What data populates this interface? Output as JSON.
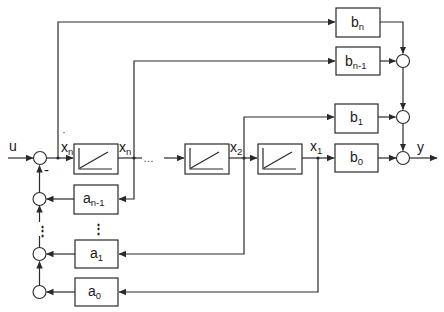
{
  "diagram": {
    "type": "block-diagram",
    "input": {
      "label": "u"
    },
    "output": {
      "label": "y"
    },
    "feedback_sign": "-",
    "states": {
      "xdot_n": {
        "base": "x",
        "sub": "n",
        "dot": "˙"
      },
      "x_n": {
        "base": "x",
        "sub": "n"
      },
      "x_2": {
        "base": "x",
        "sub": "2"
      },
      "x_1": {
        "base": "x",
        "sub": "1"
      }
    },
    "ellipsis_h": "…",
    "ellipsis_v": "⋮",
    "integrators": [
      {
        "id": "int-n",
        "symbol": "ramp"
      },
      {
        "id": "int-2",
        "symbol": "ramp"
      },
      {
        "id": "int-1",
        "symbol": "ramp"
      }
    ],
    "feedforward_gains": [
      {
        "base": "b",
        "sub": "n"
      },
      {
        "base": "b",
        "sub": "n-1"
      },
      {
        "base": "b",
        "sub": "1"
      },
      {
        "base": "b",
        "sub": "0"
      }
    ],
    "feedback_gains": [
      {
        "base": "a",
        "sub": "n-1"
      },
      {
        "base": "a",
        "sub": "1"
      },
      {
        "base": "a",
        "sub": "0"
      }
    ]
  }
}
